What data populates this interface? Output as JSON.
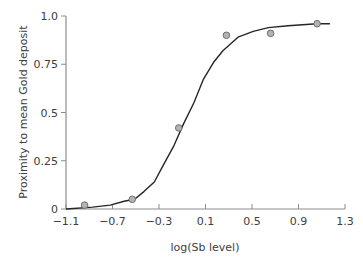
{
  "chart_data": {
    "type": "scatter",
    "title": "",
    "xlabel": "log(Sb level)",
    "ylabel": "Proximity to mean Gold deposit",
    "xlim": [
      -1.1,
      1.3
    ],
    "ylim": [
      0,
      1.0
    ],
    "x_ticks": [
      "-1.1",
      "-0.7",
      "-0.3",
      "0.1",
      "0.5",
      "0.9",
      "1.3"
    ],
    "y_ticks": [
      "0",
      "0.25",
      "0.5",
      "0.75",
      "1.0"
    ],
    "grid": false,
    "legend": null,
    "series": [
      {
        "name": "observed",
        "kind": "scatter",
        "points": [
          {
            "x": -0.94,
            "y": 0.02
          },
          {
            "x": -0.53,
            "y": 0.05
          },
          {
            "x": -0.13,
            "y": 0.42
          },
          {
            "x": 0.28,
            "y": 0.9
          },
          {
            "x": 0.66,
            "y": 0.91
          },
          {
            "x": 1.06,
            "y": 0.96
          }
        ]
      },
      {
        "name": "fitted logistic curve",
        "kind": "line",
        "points": [
          {
            "x": -1.1,
            "y": 0.0
          },
          {
            "x": -0.87,
            "y": 0.01
          },
          {
            "x": -0.72,
            "y": 0.02
          },
          {
            "x": -0.6,
            "y": 0.04
          },
          {
            "x": -0.51,
            "y": 0.05
          },
          {
            "x": -0.43,
            "y": 0.09
          },
          {
            "x": -0.34,
            "y": 0.14
          },
          {
            "x": -0.26,
            "y": 0.23
          },
          {
            "x": -0.17,
            "y": 0.33
          },
          {
            "x": -0.09,
            "y": 0.44
          },
          {
            "x": 0.0,
            "y": 0.55
          },
          {
            "x": 0.08,
            "y": 0.67
          },
          {
            "x": 0.17,
            "y": 0.76
          },
          {
            "x": 0.25,
            "y": 0.82
          },
          {
            "x": 0.38,
            "y": 0.89
          },
          {
            "x": 0.51,
            "y": 0.92
          },
          {
            "x": 0.64,
            "y": 0.94
          },
          {
            "x": 0.81,
            "y": 0.95
          },
          {
            "x": 1.06,
            "y": 0.96
          },
          {
            "x": 1.17,
            "y": 0.96
          }
        ]
      }
    ]
  },
  "colors": {
    "axis": "#8c8c8c",
    "curve": "#262626",
    "marker_fill": "#b4b4b4",
    "marker_stroke": "#6e6e6e",
    "text": "#404040"
  }
}
